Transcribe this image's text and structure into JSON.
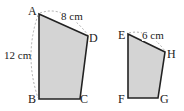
{
  "figures": [
    {
      "name": "ABCD",
      "vertices": {
        "A": "A",
        "B": "B",
        "C": "C",
        "D": "D"
      },
      "dimensions": {
        "AD": "8 cm",
        "AB": "12 cm"
      }
    },
    {
      "name": "EFGH",
      "vertices": {
        "E": "E",
        "F": "F",
        "G": "G",
        "H": "H"
      },
      "dimensions": {
        "EH": "6 cm"
      }
    }
  ],
  "colors": {
    "fill": "#d4d4d4",
    "stroke": "#222222",
    "dash": "#999999"
  }
}
